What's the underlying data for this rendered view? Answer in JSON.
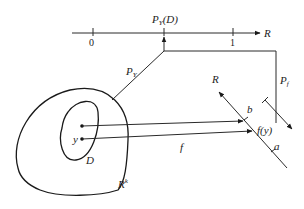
{
  "diagram": {
    "title": "",
    "axis": {
      "label": "R",
      "ticks": [
        {
          "label": "0",
          "value": 0
        },
        {
          "label": "1",
          "value": 1
        }
      ],
      "marked_point_label": "P",
      "marked_point_sub": "Y",
      "marked_point_arg": "(D)"
    },
    "maps": {
      "py_label": "P",
      "py_sub": "Y",
      "pf_label": "P",
      "pf_sub": "f",
      "f_label": "f"
    },
    "sets": {
      "outer_label": "R",
      "outer_sup": "k",
      "inner_label": "D",
      "point_label": "y"
    },
    "target_line": {
      "label": "R",
      "point_b": "b",
      "point_fy": "f(y)",
      "point_a": "a"
    },
    "colors": {
      "stroke": "#2a2a2a",
      "background": "#ffffff"
    }
  }
}
